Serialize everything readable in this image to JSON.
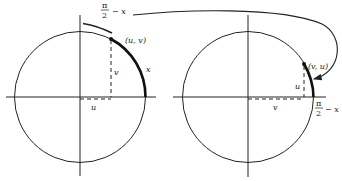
{
  "diagram": {
    "colors": {
      "ink": "#222222",
      "background": "#ffffff"
    },
    "left_circle": {
      "point_label": "(u, v)",
      "vertical_leg_label": "v",
      "horizontal_leg_label": "u",
      "arc_label": "x",
      "bracket_label_num": "π",
      "bracket_label_den": "2",
      "bracket_label_suffix": "− x"
    },
    "right_circle": {
      "point_label": "(v, u)",
      "vertical_leg_label": "u",
      "horizontal_leg_label": "v",
      "arc_label_num": "π",
      "arc_label_den": "2",
      "arc_label_suffix": "− x"
    }
  }
}
